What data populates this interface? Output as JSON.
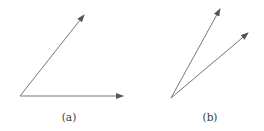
{
  "figure": {
    "stroke_color": "#777777",
    "arrowhead_color": "#555555",
    "panels": [
      {
        "id": "a",
        "label": "(a)",
        "label_pos": {
          "x": 69,
          "y": 111
        },
        "origin": {
          "x": 20,
          "y": 96
        },
        "vectors": [
          {
            "name": "upper-vector",
            "tip": {
              "x": 84,
              "y": 15
            }
          },
          {
            "name": "horizontal-vector",
            "tip": {
              "x": 123,
              "y": 96
            }
          }
        ]
      },
      {
        "id": "b",
        "label": "(b)",
        "label_pos": {
          "x": 210,
          "y": 111
        },
        "origin": {
          "x": 171,
          "y": 98
        },
        "vectors": [
          {
            "name": "steep-vector",
            "tip": {
              "x": 220,
              "y": 9
            }
          },
          {
            "name": "shallow-vector",
            "tip": {
              "x": 248,
              "y": 33
            }
          }
        ]
      }
    ]
  }
}
